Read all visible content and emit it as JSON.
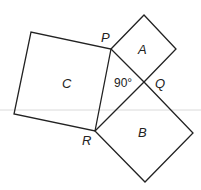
{
  "diagram": {
    "vertices": {
      "P": "P",
      "Q": "Q",
      "R": "R"
    },
    "squares": {
      "A": "A",
      "B": "B",
      "C": "C"
    },
    "angle_label": "90°",
    "colors": {
      "stroke": "#222222",
      "guide": "#cccccc",
      "background": "#ffffff"
    }
  }
}
